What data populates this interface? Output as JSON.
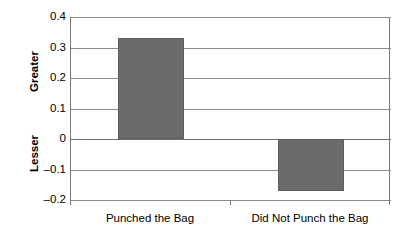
{
  "chart_data": {
    "type": "bar",
    "title": "",
    "subtitle": "",
    "xlabel": "",
    "ylabel": "",
    "categories": [
      "Punched the Bag",
      "Did Not Punch the Bag"
    ],
    "values": [
      0.33,
      -0.17
    ],
    "ylim": [
      -0.2,
      0.4
    ],
    "ytick_values": [
      0.4,
      0.3,
      0.2,
      0.1,
      0,
      -0.1,
      -0.2
    ],
    "ytick_labels": [
      "0.4",
      "0.3",
      "0.2",
      "0.1",
      "0",
      "–0.1",
      "–0.2"
    ],
    "axis_direction_labels": {
      "upper": "Greater",
      "lower": "Lesser"
    },
    "grid": true,
    "grid_axis": "y",
    "legend": false,
    "legend_position": "none",
    "bar_color": "#6b6b6b",
    "grid_color": "#8c8c8c",
    "axis_color": "#7a7a7a",
    "background_color": "#ffffff"
  }
}
